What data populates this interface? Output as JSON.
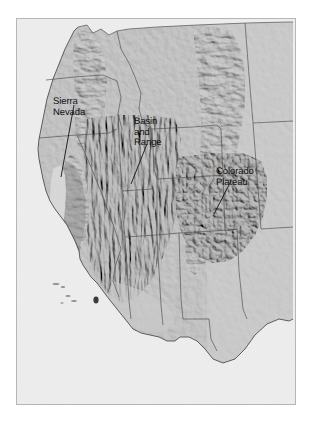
{
  "figure": {
    "kind": "shaded-relief-map",
    "region": "Western United States",
    "background_color": "#ffffff",
    "frame_color": "#b6b6b6"
  },
  "map": {
    "ocean_color": "#ededed",
    "land_color": "#c6c6c6",
    "highland_color": "#9c9c9c",
    "boundary_color": "#4a4a4a",
    "coastline_color": "#3c3c3c",
    "leader_line_color": "#111111"
  },
  "labels": [
    {
      "id": "sierra-nevada",
      "lines": [
        "Sierra",
        "Nevada"
      ],
      "text": "Sierra\nNevada",
      "leader": {
        "x1": 73,
        "y1": 104,
        "x2": 60,
        "y2": 176
      }
    },
    {
      "id": "basin-and-range",
      "lines": [
        "Basin",
        "and",
        "Range"
      ],
      "text": "Basin\nand\nRange",
      "leader": {
        "x1": 146,
        "y1": 143,
        "x2": 130,
        "y2": 183
      }
    },
    {
      "id": "colorado-plateau",
      "lines": [
        "Colorado",
        "Plateau"
      ],
      "text": "Colorado\nPlateau",
      "leader": {
        "x1": 230,
        "y1": 180,
        "x2": 213,
        "y2": 213
      }
    }
  ]
}
